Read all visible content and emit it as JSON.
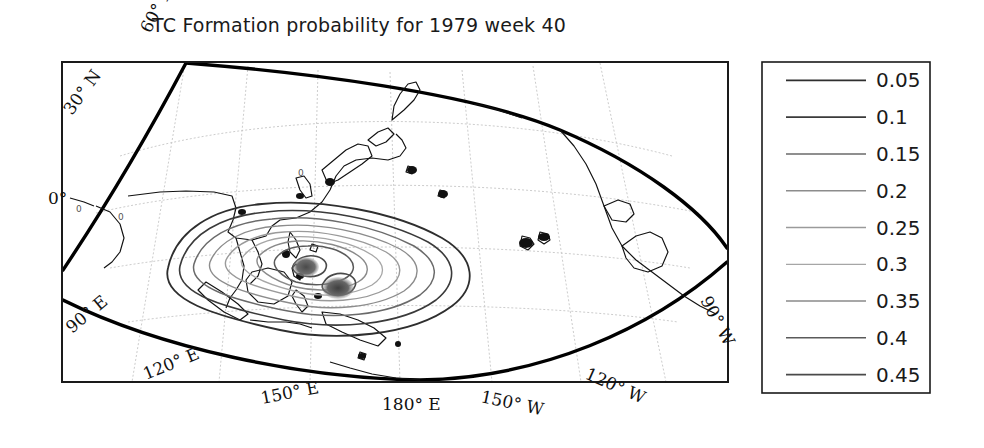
{
  "figure": {
    "title": "TC Formation probability for 1979 week 40",
    "year": "1979",
    "week": "40",
    "background_color": "#ffffff",
    "frame_color": "#1a1a1a"
  },
  "plot_box": {
    "x": 62,
    "y": 62,
    "width": 666,
    "height": 320,
    "border_color": "#1a1a1a"
  },
  "map": {
    "projection_note": "curved-frame world map, Indo-Pacific sector",
    "boundary_color": "#000000",
    "coastline_color": "#111111",
    "graticule_color": "#bbbbbb",
    "longitude_labels": [
      {
        "text": "90° E",
        "x": 96,
        "y": 336,
        "rotate": -42
      },
      {
        "text": "120° E",
        "x": 168,
        "y": 378,
        "rotate": -22
      },
      {
        "text": "150° E",
        "x": 285,
        "y": 398,
        "rotate": -10
      },
      {
        "text": "180° E",
        "x": 400,
        "y": 404,
        "rotate": 0
      },
      {
        "text": "150° W",
        "x": 498,
        "y": 396,
        "rotate": 12
      },
      {
        "text": "120° W",
        "x": 610,
        "y": 372,
        "rotate": 24
      },
      {
        "text": "90° W",
        "x": 712,
        "y": 320,
        "rotate": 60
      }
    ],
    "latitude_labels": [
      {
        "text": "60° N",
        "x": 150,
        "y": 30,
        "rotate": -60
      },
      {
        "text": "30° N",
        "x": 78,
        "y": 110,
        "rotate": -52
      },
      {
        "text": "0°",
        "x": 36,
        "y": 198,
        "rotate": 0
      }
    ],
    "contour_value_labels": [
      {
        "text": "0",
        "x": 78,
        "y": 208
      },
      {
        "text": "0",
        "x": 120,
        "y": 216
      },
      {
        "text": "0",
        "x": 300,
        "y": 172
      }
    ]
  },
  "legend": {
    "box": {
      "x": 762,
      "y": 62,
      "width": 168,
      "height": 331
    },
    "border_color": "#1a1a1a",
    "background_color": "#ffffff",
    "line_x1": 786,
    "line_x2": 866,
    "label_x": 876,
    "entries": [
      {
        "label": "0.05",
        "color": "#2e2e2e",
        "width": 1.8
      },
      {
        "label": "0.1",
        "color": "#3a3a3a",
        "width": 1.6
      },
      {
        "label": "0.15",
        "color": "#6a6a6a",
        "width": 1.5
      },
      {
        "label": "0.2",
        "color": "#8c8c8c",
        "width": 1.4
      },
      {
        "label": "0.25",
        "color": "#9a9a9a",
        "width": 1.4
      },
      {
        "label": "0.3",
        "color": "#a6a6a6",
        "width": 1.3
      },
      {
        "label": "0.35",
        "color": "#8a8a8a",
        "width": 1.4
      },
      {
        "label": "0.4",
        "color": "#5a5a5a",
        "width": 1.5
      },
      {
        "label": "0.45",
        "color": "#4a4a4a",
        "width": 1.6
      }
    ]
  },
  "chart_data": {
    "type": "contour",
    "title": "TC Formation probability for 1979 week 40",
    "xlabel": "",
    "ylabel": "",
    "variable": "TC Formation probability",
    "contour_levels": [
      0.05,
      0.1,
      0.15,
      0.2,
      0.25,
      0.3,
      0.35,
      0.4,
      0.45
    ],
    "level_colors": [
      "#2e2e2e",
      "#3a3a3a",
      "#6a6a6a",
      "#8c8c8c",
      "#9a9a9a",
      "#a6a6a6",
      "#8a8a8a",
      "#5a5a5a",
      "#4a4a4a"
    ],
    "x_tick_labels": [
      "90° E",
      "120° E",
      "150° E",
      "180° E",
      "150° W",
      "120° W",
      "90° W"
    ],
    "y_tick_labels": [
      "0°",
      "30° N",
      "60° N"
    ],
    "xlim": [
      "90E",
      "90W"
    ],
    "ylim": [
      "0",
      "60N"
    ],
    "grid": true,
    "legend_position": "right-outside",
    "maxima": [
      {
        "label": "western maximum",
        "lon": "approx 140E",
        "lat": "approx 10N",
        "value": 0.45
      },
      {
        "label": "eastern maximum",
        "lon": "approx 150E",
        "lat": "approx 5N",
        "value": 0.45
      }
    ]
  }
}
